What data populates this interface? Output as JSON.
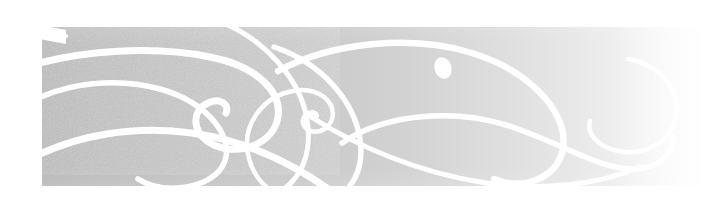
{
  "page": {
    "background_color": "#ffffff",
    "width": 712,
    "height": 213
  },
  "banner": {
    "name": "decorative-swirl-banner",
    "alt_text": "Decorative grey banner with white calligraphic swirl flourishes",
    "bounds": {
      "x": 42,
      "y": 27,
      "width": 659,
      "height": 159
    },
    "fill_style": "horizontal-gradient",
    "gradient_from": "#b8b8b8",
    "gradient_to": "#fbfbfb",
    "texture": "grain-noise",
    "texture_opacity": 0.55,
    "ornament_color": "#ffffff",
    "ornament_count": 9
  },
  "ornaments": [
    {
      "name": "left-large-spiral",
      "stroke_width": 5.5
    },
    {
      "name": "left-inner-curl",
      "stroke_width": 3.0
    },
    {
      "name": "lower-left-sweep",
      "stroke_width": 6.5
    },
    {
      "name": "center-tight-spiral",
      "stroke_width": 4.0
    },
    {
      "name": "center-large-loop",
      "stroke_width": 5.0
    },
    {
      "name": "upper-arc-sweep",
      "stroke_width": 6.0
    },
    {
      "name": "right-large-loop",
      "stroke_width": 5.5
    },
    {
      "name": "right-hook-curl",
      "stroke_width": 4.5
    },
    {
      "name": "accent-teardrop-dot",
      "stroke_width": 0
    }
  ]
}
